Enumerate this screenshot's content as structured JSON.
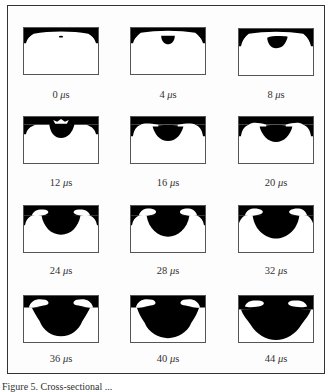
{
  "figure": {
    "caption_partial": "Figure 5. Cross-sectional ...",
    "unit": "μs",
    "panels": [
      {
        "time": "0",
        "label": "0 μs"
      },
      {
        "time": "4",
        "label": "4 μs"
      },
      {
        "time": "8",
        "label": "8 μs"
      },
      {
        "time": "12",
        "label": "12 μs"
      },
      {
        "time": "16",
        "label": "16 μs"
      },
      {
        "time": "20",
        "label": "20 μs"
      },
      {
        "time": "24",
        "label": "24 μs"
      },
      {
        "time": "28",
        "label": "28 μs"
      },
      {
        "time": "32",
        "label": "32 μs"
      },
      {
        "time": "36",
        "label": "36 μs"
      },
      {
        "time": "40",
        "label": "40 μs"
      },
      {
        "time": "44",
        "label": "44 μs"
      }
    ],
    "layout": {
      "rows": 4,
      "cols": 3
    },
    "colors": {
      "ink": "#000000",
      "background": "#ffffff",
      "frame": "#333333"
    }
  }
}
